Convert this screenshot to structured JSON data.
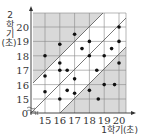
{
  "chart_data": {
    "type": "scatter",
    "title": "",
    "xlabel": "1학기(초)",
    "ylabel_lines": [
      "2",
      "학",
      "기",
      "(초)"
    ],
    "ylabel": "2학기(초)",
    "x_ticks": [
      "15",
      "16",
      "17",
      "18",
      "19",
      "20"
    ],
    "y_ticks": [
      "15",
      "16",
      "17",
      "18",
      "19",
      "20"
    ],
    "origin_label": "0",
    "xlim": [
      14.2,
      20.5
    ],
    "ylim": [
      14.2,
      20.5
    ],
    "grid": true,
    "axis_break": true,
    "reference_lines": [
      {
        "name": "upper",
        "equation": "y = x + 1"
      },
      {
        "name": "middle",
        "equation": "y = x"
      },
      {
        "name": "lower",
        "equation": "y = x - 1"
      }
    ],
    "shaded_regions": [
      "above upper line",
      "below lower line"
    ],
    "points": [
      {
        "x": 15,
        "y": 18
      },
      {
        "x": 15,
        "y": 16.6
      },
      {
        "x": 15,
        "y": 15.5
      },
      {
        "x": 16,
        "y": 18.8
      },
      {
        "x": 16,
        "y": 17.5
      },
      {
        "x": 16,
        "y": 17
      },
      {
        "x": 16,
        "y": 15
      },
      {
        "x": 16.5,
        "y": 17
      },
      {
        "x": 16.5,
        "y": 15.6
      },
      {
        "x": 17,
        "y": 19.5
      },
      {
        "x": 17,
        "y": 16.4
      },
      {
        "x": 17,
        "y": 15.4
      },
      {
        "x": 17.5,
        "y": 18.5
      },
      {
        "x": 18,
        "y": 19
      },
      {
        "x": 18,
        "y": 18
      },
      {
        "x": 18,
        "y": 15.6
      },
      {
        "x": 18.5,
        "y": 17
      },
      {
        "x": 18.6,
        "y": 15
      },
      {
        "x": 19,
        "y": 18
      },
      {
        "x": 19,
        "y": 16
      },
      {
        "x": 19.5,
        "y": 18.5
      },
      {
        "x": 19.7,
        "y": 16
      },
      {
        "x": 20,
        "y": 20
      },
      {
        "x": 20,
        "y": 19
      },
      {
        "x": 20,
        "y": 17.5
      }
    ]
  },
  "colors": {
    "shade": "#d9d9d9",
    "grid": "#888888",
    "line": "#555555",
    "dot": "#111111",
    "axis": "#333333"
  }
}
